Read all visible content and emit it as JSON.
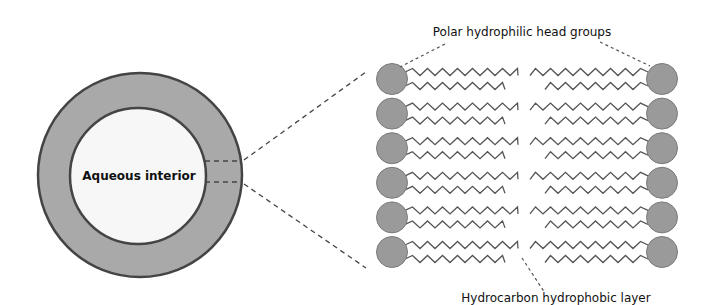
{
  "diagram": {
    "vesicle": {
      "interior_label": "Aqueous interior",
      "colors": {
        "shell": "#a9a9a9",
        "interior": "#f7f7f7",
        "outline": "#444444"
      }
    },
    "bilayer": {
      "head_label": "Polar hydrophilic head groups",
      "tail_label": "Hydrocarbon hydrophobic layer",
      "rows": 6,
      "colors": {
        "head": "#9a9a9a",
        "head_outline": "#7a7a7a",
        "tail": "#555555"
      }
    },
    "connector_style": "dashed"
  }
}
